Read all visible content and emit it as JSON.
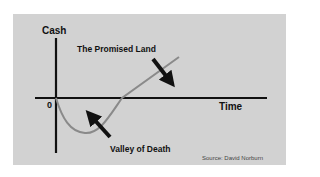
{
  "diagram": {
    "y_axis_label": "Cash",
    "x_axis_label": "Time",
    "origin_label": "0",
    "annotations": {
      "upper": "The Promised Land",
      "lower": "Valley of Death"
    },
    "source": "Source: David Norburn",
    "colors": {
      "background": "#d2d2d2",
      "axis": "#111111",
      "curve": "#8a8a8a",
      "arrow": "#111111"
    },
    "curve_description": "Cash dips below zero after start (valley), crosses zero, then rises steadily"
  }
}
